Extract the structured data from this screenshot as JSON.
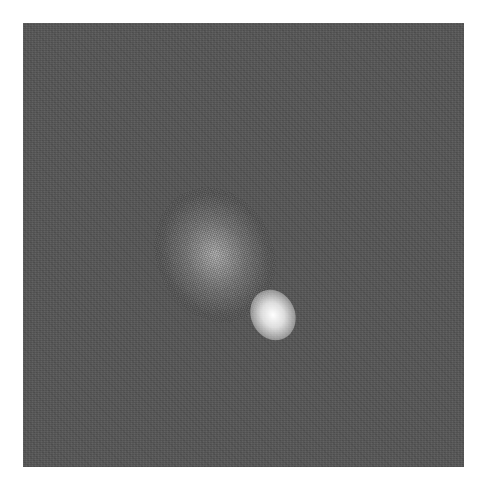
{
  "image": {
    "description": "Grayscale noisy square image with a bright elliptical blob in the lower-right center",
    "frame": {
      "x": 23,
      "y": 23,
      "width": 441,
      "height": 444
    },
    "background_color": "#5a5a5a",
    "page_color": "#ffffff",
    "blob": {
      "center_x": 273,
      "center_y": 315,
      "color_peak": "#ffffff",
      "orientation_deg": -25
    }
  }
}
